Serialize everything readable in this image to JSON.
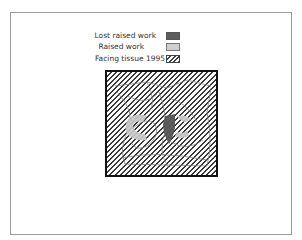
{
  "figure": {
    "legend": {
      "items": [
        {
          "label": "Lost raised work",
          "swatch": "dark-fill",
          "color": "#5c5c5c"
        },
        {
          "label": "Raised work",
          "swatch": "light-fill",
          "color": "#cfcfcf"
        },
        {
          "label": "Facing tissue 1995",
          "swatch": "diagonal-hatch",
          "color": "#444444"
        }
      ]
    },
    "drawing": {
      "description": "Hatched map of facing tissue over an object outline with regions of raised work and lost raised work",
      "border_color": "#111111"
    }
  }
}
